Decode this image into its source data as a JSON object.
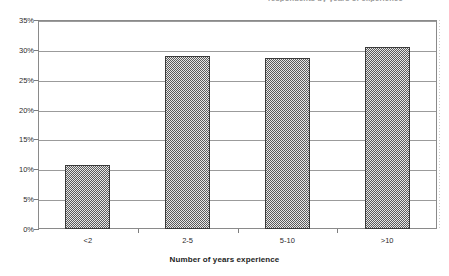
{
  "chart_data": {
    "type": "bar",
    "title": "respondents by years of experience",
    "categories": [
      "<2",
      "2-5",
      "5-10",
      ">10"
    ],
    "values": [
      10.8,
      28.9,
      28.7,
      30.5
    ],
    "xlabel": "Number of years experience",
    "ylabel": "",
    "ylim": [
      0,
      35
    ],
    "ytick_labels": [
      "0%",
      "5%",
      "10%",
      "15%",
      "20%",
      "25%",
      "30%",
      "35%"
    ],
    "ytick_values": [
      0,
      5,
      10,
      15,
      20,
      25,
      30,
      35
    ],
    "grid": true,
    "legend": "none",
    "bar_color": "#808080",
    "bar_border_color": "#3b3b3b",
    "axis_color": "#8a8a8a",
    "gridline_color": "#9b9b9b"
  }
}
